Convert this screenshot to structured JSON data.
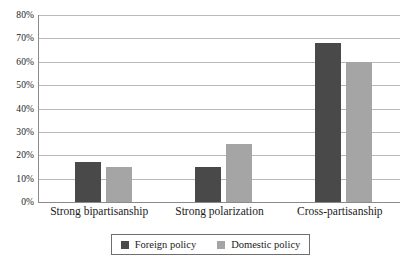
{
  "chart_data": {
    "type": "bar",
    "title": "",
    "subtitle": "",
    "xlabel": "",
    "ylabel": "",
    "categories": [
      "Strong bipartisanship",
      "Strong polarization",
      "Cross-partisanship"
    ],
    "series": [
      {
        "name": "Foreign policy",
        "color": "#494949",
        "values": [
          17,
          15,
          68
        ]
      },
      {
        "name": "Domestic policy",
        "color": "#a5a5a5",
        "values": [
          15,
          25,
          60
        ]
      }
    ],
    "ylim": [
      0,
      80
    ],
    "ytick_values": [
      0,
      10,
      20,
      30,
      40,
      50,
      60,
      70,
      80
    ],
    "ytick_labels": [
      "0%",
      "10%",
      "20%",
      "30%",
      "40%",
      "50%",
      "60%",
      "70%",
      "80%"
    ],
    "value_suffix": "%",
    "grid": true,
    "grid_axis": "y",
    "legend_position": "bottom",
    "legend_border": true,
    "axis_line_color": "#8a8a8a",
    "gridline_color": "#b9b9b9",
    "background": "#ffffff"
  }
}
